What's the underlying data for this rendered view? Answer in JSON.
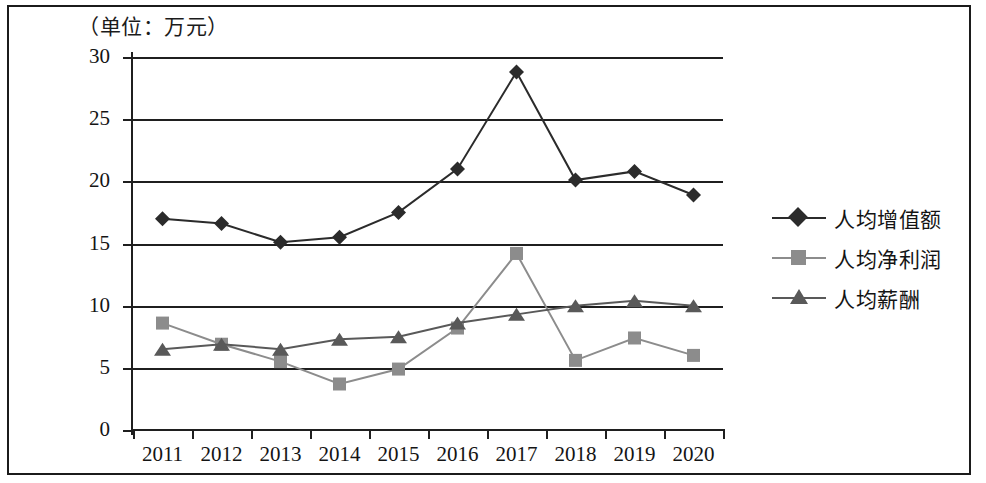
{
  "caption": "（单位：万元）",
  "legend": {
    "position": "right",
    "items": [
      {
        "label": "人均增值额",
        "marker": "diamond",
        "color": "#2b2b2b"
      },
      {
        "label": "人均净利润",
        "marker": "square",
        "color": "#8c8c8c"
      },
      {
        "label": "人均薪酬",
        "marker": "triangle",
        "color": "#595959"
      }
    ]
  },
  "chart_data": {
    "type": "line",
    "title": "",
    "subtitle": "",
    "xlabel": "",
    "ylabel": "",
    "unit": "万元",
    "grid": true,
    "legend_position": "right",
    "categories": [
      "2011",
      "2012",
      "2013",
      "2014",
      "2015",
      "2016",
      "2017",
      "2018",
      "2019",
      "2020"
    ],
    "ylim": [
      0,
      30
    ],
    "yticks": [
      0,
      5,
      10,
      15,
      20,
      25,
      30
    ],
    "ytick_labels": [
      "0",
      "5",
      "10",
      "15",
      "20",
      "25",
      "30"
    ],
    "series": [
      {
        "name": "人均增值额",
        "marker": "diamond",
        "color": "#2b2b2b",
        "values": [
          17.0,
          16.6,
          15.1,
          15.5,
          17.5,
          21.0,
          28.8,
          20.1,
          20.8,
          18.9
        ]
      },
      {
        "name": "人均净利润",
        "marker": "square",
        "color": "#8c8c8c",
        "values": [
          8.6,
          6.9,
          5.5,
          3.7,
          4.9,
          8.2,
          14.2,
          5.6,
          7.4,
          6.0
        ]
      },
      {
        "name": "人均薪酬",
        "marker": "triangle",
        "color": "#595959",
        "values": [
          6.5,
          6.9,
          6.5,
          7.3,
          7.5,
          8.6,
          9.3,
          10.0,
          10.4,
          10.0
        ]
      }
    ]
  }
}
